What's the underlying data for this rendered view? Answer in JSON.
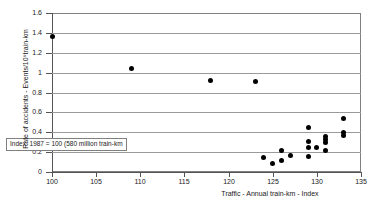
{
  "chart_data": {
    "type": "scatter",
    "title": "",
    "xlabel": "Traffic - Annual train-km - Index",
    "ylabel": "Rate of accidents - Events/10⁶train-km",
    "xlim": [
      100,
      135
    ],
    "ylim": [
      0,
      1.6
    ],
    "xticks": [
      "100",
      "105",
      "110",
      "115",
      "120",
      "125",
      "130",
      "135"
    ],
    "xtick_values": [
      100,
      105,
      110,
      115,
      120,
      125,
      130,
      135
    ],
    "yticks": [
      "0",
      "0.2",
      "0.4",
      "0.6",
      "0.8",
      "1",
      "1.2",
      "1.4",
      "1.6"
    ],
    "ytick_values": [
      0,
      0.2,
      0.4,
      0.6,
      0.8,
      1,
      1.2,
      1.4,
      1.6
    ],
    "grid": "horizontal",
    "legend": "none",
    "marker": "filled-circle",
    "marker_color": "#000000",
    "annotations": [
      {
        "id": "index-note",
        "text": "Index: 1987 = 100 (580 million train-km",
        "x": 100.6,
        "y": 0.22
      }
    ],
    "points": [
      {
        "x": 100,
        "y": 1.36
      },
      {
        "x": 109,
        "y": 1.04
      },
      {
        "x": 118,
        "y": 0.92
      },
      {
        "x": 123,
        "y": 0.91
      },
      {
        "x": 124,
        "y": 0.145
      },
      {
        "x": 125,
        "y": 0.085
      },
      {
        "x": 126,
        "y": 0.12
      },
      {
        "x": 126,
        "y": 0.22
      },
      {
        "x": 127,
        "y": 0.165
      },
      {
        "x": 129,
        "y": 0.16
      },
      {
        "x": 129,
        "y": 0.245
      },
      {
        "x": 129,
        "y": 0.305
      },
      {
        "x": 129,
        "y": 0.45
      },
      {
        "x": 130,
        "y": 0.245
      },
      {
        "x": 131,
        "y": 0.215
      },
      {
        "x": 131,
        "y": 0.3
      },
      {
        "x": 131,
        "y": 0.325
      },
      {
        "x": 131,
        "y": 0.36
      },
      {
        "x": 133,
        "y": 0.365
      },
      {
        "x": 133,
        "y": 0.4
      },
      {
        "x": 133,
        "y": 0.54
      }
    ]
  }
}
